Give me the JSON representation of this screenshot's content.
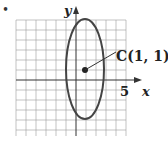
{
  "bullet": "•",
  "axes": {
    "x_label": "x",
    "y_label": "y",
    "x_tick_label": "5"
  },
  "center": {
    "label": "C(1, 1)",
    "x": 1,
    "y": 1
  },
  "ellipse": {
    "center_x": 1,
    "center_y": 1,
    "semi_axis_x": 2,
    "semi_axis_y": 5
  },
  "grid": {
    "x_min": -6,
    "x_max": 5,
    "y_min": -4,
    "y_max": 7
  },
  "colors": {
    "curve": "#444444",
    "grid": "#999999",
    "axis": "#333333"
  }
}
